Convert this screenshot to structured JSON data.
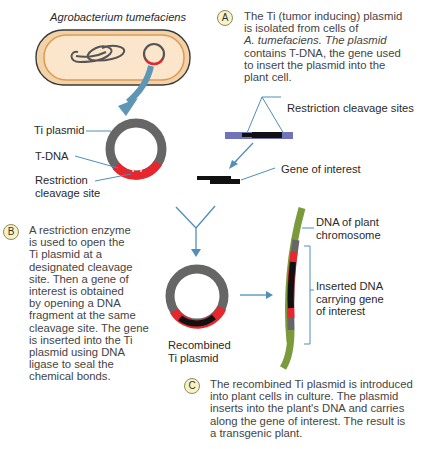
{
  "title": "Agrobacterium tumefaciens",
  "labels": {
    "ti_plasmid": "Ti plasmid",
    "t_dna": "T-DNA",
    "restriction_site_line1": "Restriction",
    "restriction_site_line2": "cleavage site",
    "restriction_sites": "Restriction cleavage sites",
    "gene_of_interest": "Gene of interest",
    "dna_plant_line1": "DNA of plant",
    "dna_plant_line2": "chromosome",
    "inserted_line1": "Inserted DNA",
    "inserted_line2": "carrying gene",
    "inserted_line3": "of interest",
    "recombined_line1": "Recombined",
    "recombined_line2": "Ti plasmid"
  },
  "steps": [
    {
      "badge": "A",
      "lines": [
        "The Ti (tumor inducing) plasmid",
        "is isolated from cells of",
        "A. tumefaciens. The plasmid",
        "contains T-DNA, the gene used",
        "to insert the plasmid into the",
        "plant cell."
      ]
    },
    {
      "badge": "B",
      "lines": [
        "A restriction enzyme",
        "is used to open the",
        "Ti plasmid at a",
        "designated cleavage",
        "site. Then a gene of",
        "interest is obtained",
        "by opening a DNA",
        "fragment at the same",
        "cleavage site. The gene",
        "is inserted into the Ti",
        "plasmid using DNA",
        "ligase to seal the",
        "chemical bonds."
      ]
    },
    {
      "badge": "C",
      "lines": [
        "The recombined Ti plasmid is introduced",
        "into plant cells in culture. The plasmid",
        "inserts into the plant's DNA and carries",
        "along the gene of interest. The result is",
        "a transgenic plant."
      ]
    }
  ],
  "colors": {
    "plasmid_gray": "#666666",
    "t_dna_red": "#e8262e",
    "gene_black": "#111111",
    "plant_dna_green": "#7a9a3c",
    "arrow_blue": "#4f8fb8",
    "bacterium_fill": "#f6d9b4",
    "badge_fill": "#fbf2c4",
    "fragment_blue": "#6f74b8"
  }
}
